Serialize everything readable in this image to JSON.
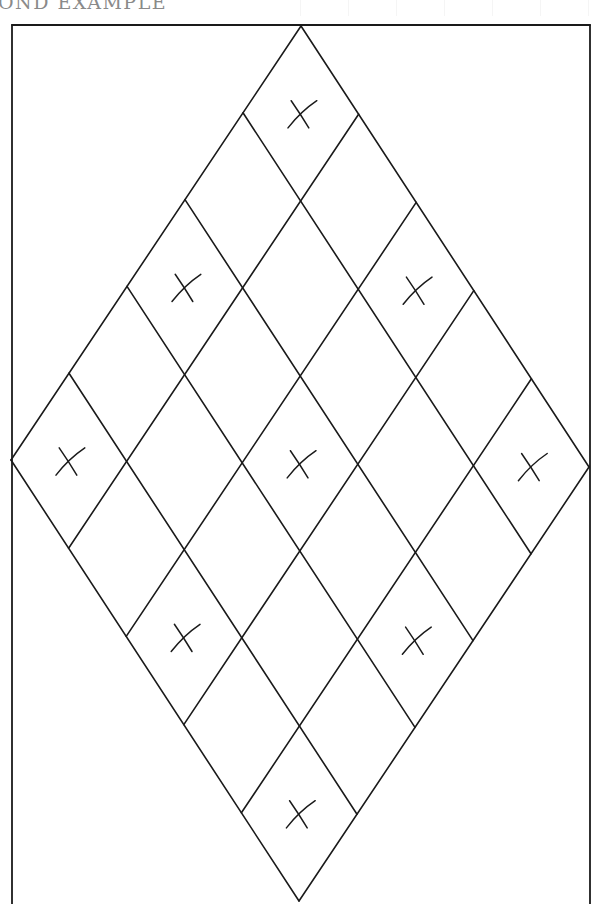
{
  "header": {
    "title": "OND EXAMPLE"
  },
  "diagram": {
    "frame": {
      "left": 12,
      "top": 25,
      "right": 590,
      "bottom": 904
    },
    "rhombus": {
      "top": [
        301,
        26
      ],
      "left": [
        11,
        460
      ],
      "right": [
        589,
        467
      ],
      "bottom": [
        290,
        904
      ],
      "divisions": 5
    },
    "marked_cells": [
      [
        0,
        0
      ],
      [
        0,
        2
      ],
      [
        0,
        4
      ],
      [
        2,
        0
      ],
      [
        2,
        2
      ],
      [
        2,
        4
      ],
      [
        4,
        0
      ],
      [
        4,
        2
      ],
      [
        4,
        4
      ]
    ],
    "mark_glyph": "×",
    "line_color": "#1a1a1a",
    "heading_color": "#8a8a8a"
  }
}
